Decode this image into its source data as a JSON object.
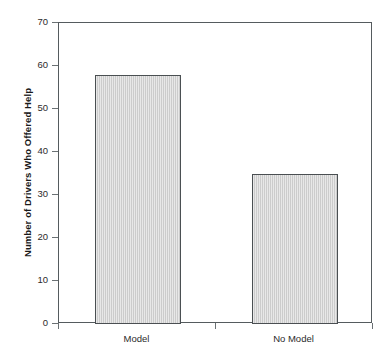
{
  "chart_data": {
    "type": "bar",
    "title": "",
    "subtitle": "",
    "xlabel": "",
    "ylabel": "Number of Drivers Who Offered Help",
    "categories": [
      "Model",
      "No Model"
    ],
    "values": [
      58,
      35
    ],
    "ylim": [
      0,
      70
    ],
    "yticks": [
      0,
      10,
      20,
      30,
      40,
      50,
      60,
      70
    ],
    "ytick_labels": [
      "0",
      "10",
      "20",
      "30",
      "40",
      "50",
      "60",
      "70"
    ],
    "grid": false,
    "legend": null,
    "legend_position": "none",
    "bar_fill_color": "#cccccc",
    "bar_edge_color": "#4a4f52",
    "axis_color": "#555b5e",
    "text_color": "#2b2b2b",
    "background_color": "#ffffff",
    "annotations": []
  }
}
